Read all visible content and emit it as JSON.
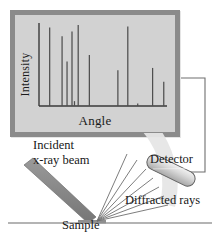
{
  "figure": {
    "background_color": "#ffffff",
    "line_color": "#4a4a4a",
    "panel_border_color": "#8b8b8b",
    "panel_fill_color": "#d2d2d2",
    "beam_color": "#8c8c8c",
    "arc_color": "#e2e2e2"
  },
  "chart_data": {
    "type": "bar",
    "title": "",
    "xlabel": "Angle",
    "ylabel": "Intensity",
    "grid": false,
    "legend": null,
    "xlim": [
      0,
      100
    ],
    "ylim": [
      0,
      100
    ],
    "categories": [
      "p1",
      "p2",
      "p3",
      "p4",
      "p5",
      "p6",
      "p7",
      "p8",
      "p9",
      "p10",
      "p11",
      "p12"
    ],
    "x": [
      7,
      17,
      21,
      25,
      27,
      30,
      39,
      62,
      70,
      78,
      90,
      99
    ],
    "values": [
      97,
      86,
      55,
      92,
      6,
      100,
      63,
      44,
      98,
      3,
      47,
      30
    ],
    "series": [
      {
        "name": "Diffracted intensity",
        "values": [
          97,
          86,
          55,
          92,
          6,
          100,
          63,
          44,
          98,
          3,
          47,
          30
        ]
      }
    ],
    "axis_tick_labels": {
      "x": [],
      "y": []
    },
    "annotations": []
  },
  "chart_panel": {
    "name": "diffractogram-panel",
    "ylabel": "Intensity",
    "xlabel": "Angle"
  },
  "schematic": {
    "labels": {
      "incident_line1": "Incident",
      "incident_line2": "x-ray beam",
      "detector": "Detector",
      "diffracted": "Diffracted rays",
      "sample": "Sample"
    },
    "elements": {
      "incident_beam": "incident-x-ray-beam",
      "sample_surface": "sample-surface-line",
      "detector_body": "detector-body",
      "diffracted_fan": "diffracted-ray-fan",
      "arc": "detector-sweep-arc",
      "connector": "detector-to-chart-connector"
    },
    "diffracted_ray_count": 7
  }
}
